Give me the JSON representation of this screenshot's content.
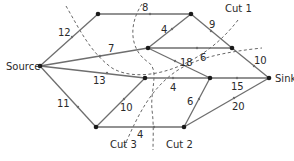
{
  "diagram": {
    "type": "flow-network",
    "nodes": [
      {
        "id": "source",
        "label": "Source",
        "x": 40,
        "y": 66
      },
      {
        "id": "a",
        "label": "",
        "x": 98,
        "y": 14
      },
      {
        "id": "b",
        "label": "",
        "x": 191,
        "y": 14
      },
      {
        "id": "c",
        "label": "",
        "x": 148,
        "y": 48
      },
      {
        "id": "d",
        "label": "",
        "x": 232,
        "y": 48
      },
      {
        "id": "e",
        "label": "",
        "x": 145,
        "y": 78
      },
      {
        "id": "f",
        "label": "",
        "x": 210,
        "y": 78
      },
      {
        "id": "sink",
        "label": "Sink",
        "x": 269,
        "y": 78
      },
      {
        "id": "g",
        "label": "",
        "x": 96,
        "y": 127
      },
      {
        "id": "h",
        "label": "",
        "x": 184,
        "y": 127
      }
    ],
    "edges": [
      {
        "from": "source",
        "to": "a",
        "capacity": "12"
      },
      {
        "from": "source",
        "to": "c",
        "capacity": "7"
      },
      {
        "from": "source",
        "to": "e",
        "capacity": "13"
      },
      {
        "from": "source",
        "to": "g",
        "capacity": "11"
      },
      {
        "from": "a",
        "to": "b",
        "capacity": "8"
      },
      {
        "from": "c",
        "to": "b",
        "capacity": "4"
      },
      {
        "from": "b",
        "to": "sink",
        "capacity": "9"
      },
      {
        "from": "c",
        "to": "d",
        "capacity": "6"
      },
      {
        "from": "d",
        "to": "sink",
        "capacity": "10"
      },
      {
        "from": "c",
        "to": "f",
        "capacity": "18"
      },
      {
        "from": "e",
        "to": "f",
        "capacity": "4"
      },
      {
        "from": "f",
        "to": "sink",
        "capacity": "15"
      },
      {
        "from": "g",
        "to": "e",
        "capacity": "10"
      },
      {
        "from": "g",
        "to": "h",
        "capacity": "4"
      },
      {
        "from": "h",
        "to": "f",
        "capacity": "6"
      },
      {
        "from": "h",
        "to": "sink",
        "capacity": "20"
      }
    ],
    "cuts": [
      {
        "label": "Cut 1"
      },
      {
        "label": "Cut 2"
      },
      {
        "label": "Cut 3"
      }
    ]
  }
}
